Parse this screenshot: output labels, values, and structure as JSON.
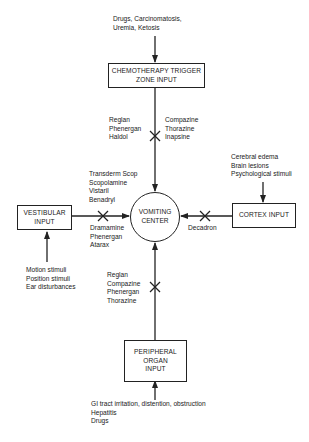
{
  "diagram": {
    "center": {
      "lines": [
        "VOMITING",
        "CENTER"
      ]
    },
    "inputs": {
      "ctz": {
        "title_lines": [
          "CHEMOTHERAPY TRIGGER",
          "ZONE INPUT"
        ],
        "stimuli": [
          "Drugs, Carcinomatosis,",
          "Uremia, Ketosis"
        ],
        "drugs_left": [
          "Reglan",
          "Phenergan",
          "Haldol"
        ],
        "drugs_right": [
          "Compazine",
          "Thorazine",
          "Inapsine"
        ]
      },
      "vestibular": {
        "title_lines": [
          "VESTIBULAR",
          "INPUT"
        ],
        "stimuli": [
          "Motion stimuli",
          "Position stimuli",
          "Ear disturbances"
        ],
        "drugs_above": [
          "Transderm Scop",
          "Scopolamine",
          "Vistaril",
          "Benadryl"
        ],
        "drugs_below": [
          "Dramamine",
          "Phenergan",
          "Atarax"
        ]
      },
      "cortex": {
        "title_lines": [
          "CORTEX INPUT"
        ],
        "stimuli": [
          "Cerebral edema",
          "Brain lesions",
          "Psychological stimuli"
        ],
        "drugs_below": [
          "Decadron"
        ]
      },
      "peripheral": {
        "title_lines": [
          "PERIPHERAL",
          "ORGAN",
          "INPUT"
        ],
        "stimuli": [
          "GI tract irritation, distention, obstruction",
          "Hepatitis",
          "Drugs"
        ],
        "drugs_left": [
          "Reglan",
          "Compazine",
          "Phenergan",
          "Thorazine"
        ]
      }
    },
    "colors": {
      "line": "#222222",
      "text": "#1a1a1a",
      "background": "#ffffff"
    }
  }
}
